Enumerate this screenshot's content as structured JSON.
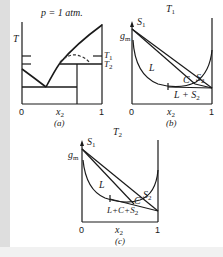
{
  "colors": {
    "ink": "#1a1a1a",
    "strip": "#dedede",
    "dashed": "#333333"
  },
  "panel_a": {
    "title": "p = 1 atm.",
    "y_axis_label": "T",
    "x_axis_label": "x",
    "x_axis_sub": "2",
    "x_ticks": [
      "0",
      "1"
    ],
    "temp_marks": [
      {
        "label": "T",
        "sub": "1"
      },
      {
        "label": "T",
        "sub": "2"
      }
    ],
    "caption": "(a)"
  },
  "panel_b": {
    "title": "T",
    "title_sub": "1",
    "y_axis_label": "g",
    "y_axis_sub": "m",
    "region_labels": {
      "S1": {
        "label": "S",
        "sub": "1"
      },
      "L": "L",
      "C": "C",
      "S2": {
        "label": "S",
        "sub": "2"
      },
      "L_S2": {
        "label": "L + S",
        "sub": "2"
      }
    },
    "x_axis_label": "x",
    "x_axis_sub": "2",
    "x_ticks": [
      "0",
      "1"
    ],
    "caption": "(b)"
  },
  "panel_c": {
    "title": "T",
    "title_sub": "2",
    "y_axis_label": "g",
    "y_axis_sub": "m",
    "region_labels": {
      "S1": {
        "label": "S",
        "sub": "1"
      },
      "L": "L",
      "C": "C",
      "S2": {
        "label": "S",
        "sub": "2"
      },
      "L_C_S2": {
        "label": "L+C+S",
        "sub": "2"
      }
    },
    "x_axis_label": "x",
    "x_axis_sub": "2",
    "x_ticks": [
      "0",
      "1"
    ],
    "caption": "(c)"
  }
}
